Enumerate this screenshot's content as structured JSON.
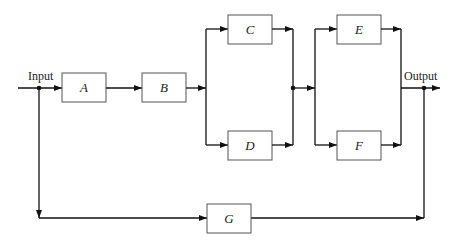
{
  "diagram": {
    "type": "block-diagram",
    "input_label": "Input",
    "output_label": "Output",
    "blocks": [
      {
        "id": "A",
        "label": "A"
      },
      {
        "id": "B",
        "label": "B"
      },
      {
        "id": "C",
        "label": "C"
      },
      {
        "id": "D",
        "label": "D"
      },
      {
        "id": "E",
        "label": "E"
      },
      {
        "id": "F",
        "label": "F"
      },
      {
        "id": "G",
        "label": "G"
      }
    ],
    "connections": [
      {
        "from": "Input",
        "to": "A"
      },
      {
        "from": "A",
        "to": "B"
      },
      {
        "from": "B",
        "to": "C"
      },
      {
        "from": "B",
        "to": "D"
      },
      {
        "from": "C",
        "to": "E"
      },
      {
        "from": "C",
        "to": "F"
      },
      {
        "from": "D",
        "to": "E"
      },
      {
        "from": "D",
        "to": "F"
      },
      {
        "from": "E",
        "to": "Output"
      },
      {
        "from": "F",
        "to": "Output"
      },
      {
        "from": "Input",
        "to": "G"
      },
      {
        "from": "G",
        "to": "Output"
      }
    ]
  }
}
